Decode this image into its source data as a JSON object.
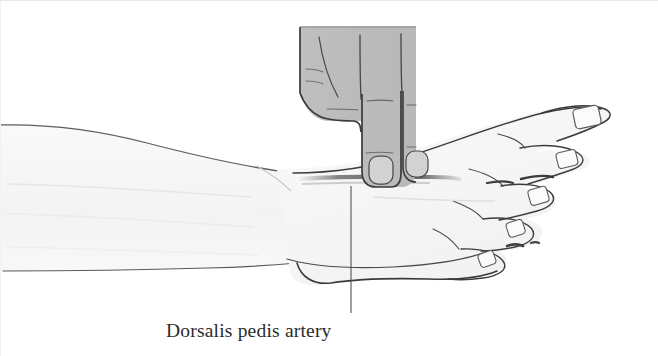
{
  "figure": {
    "type": "medical-illustration",
    "background_color": "#ffffff",
    "width": 658,
    "height": 356
  },
  "annotation": {
    "label": "Dorsalis pedis artery",
    "label_x": 165,
    "label_y": 336,
    "leader_line": {
      "x": 350,
      "y_top": 185,
      "y_bottom": 312,
      "color": "#4a4a4a"
    }
  },
  "anatomy": {
    "foot": {
      "name": "right-foot-lateral-view",
      "fill_color": "#f7f7f7",
      "outline_color": "#3a3a3a",
      "toe_count": 5,
      "toenails_visible": true
    },
    "leg": {
      "name": "lower-leg-shin",
      "fill_color": "#f9f9f9",
      "outline_color": "#555555"
    },
    "hand": {
      "name": "examiner-hand",
      "fill_color": "#bcbcbc",
      "outline_color": "#3a3a3a",
      "extended_fingers": 2,
      "description": "Index and middle fingers extended, pressing on dorsum of foot"
    }
  },
  "colors": {
    "ink": "#3a3a3a",
    "hand_gray": "#bcbcbc",
    "skin_light": "#f7f7f7",
    "shadow_gray": "#8d8d8d",
    "caption_ink": "#2b2b2b",
    "border": "#ececec"
  }
}
